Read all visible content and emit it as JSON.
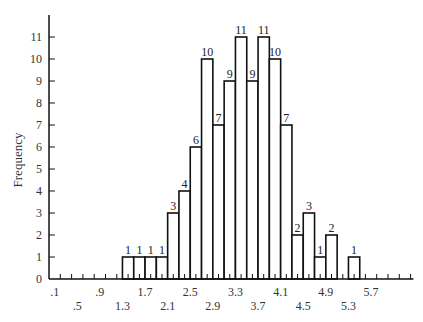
{
  "chart_data": {
    "type": "bar",
    "title": "",
    "xlabel": "",
    "ylabel": "Frequency",
    "bin_width": 0.2,
    "bin_starts": [
      1.3,
      1.5,
      1.7,
      1.9,
      2.1,
      2.3,
      2.5,
      2.7,
      2.9,
      3.1,
      3.3,
      3.5,
      3.7,
      3.9,
      4.1,
      4.3,
      4.5,
      4.7,
      4.9,
      5.1,
      5.3
    ],
    "values": [
      1,
      1,
      1,
      1,
      3,
      4,
      6,
      10,
      7,
      9,
      11,
      9,
      11,
      10,
      7,
      2,
      3,
      1,
      2,
      0,
      1
    ],
    "xlim": [
      0.0,
      6.5
    ],
    "ylim": [
      0,
      12
    ],
    "y_ticks": [
      0,
      1,
      2,
      3,
      4,
      5,
      6,
      7,
      8,
      9,
      10,
      11
    ],
    "x_tick_labels_row1": [
      ".1",
      ".9",
      "1.7",
      "2.5",
      "3.3",
      "4.1",
      "4.9",
      "5.7"
    ],
    "x_tick_labels_row1_values": [
      0.1,
      0.9,
      1.7,
      2.5,
      3.3,
      4.1,
      4.9,
      5.7
    ],
    "x_tick_labels_row2": [
      ".5",
      "1.3",
      "2.1",
      "2.9",
      "3.7",
      "4.5",
      "5.3"
    ],
    "x_tick_labels_row2_values": [
      0.5,
      1.3,
      2.1,
      2.9,
      3.7,
      4.5,
      5.3
    ],
    "grid": false,
    "legend": null,
    "bar_fill": "#ffffff",
    "bar_stroke": "#111111"
  }
}
